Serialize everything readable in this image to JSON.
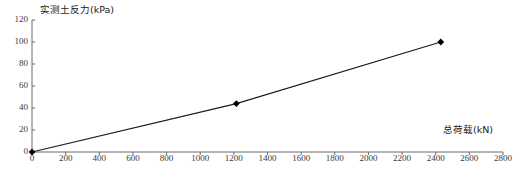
{
  "chart_data": {
    "type": "line",
    "title": "",
    "xlabel": "总荷载(kN)",
    "ylabel": "实测土反力(kPa)",
    "xlim": [
      0,
      2800
    ],
    "ylim": [
      0,
      120
    ],
    "grid": false,
    "legend": null,
    "marker": "diamond",
    "line_color": "#1a1a1a",
    "marker_color": "#000000",
    "xticks": [
      0,
      200,
      400,
      600,
      800,
      1000,
      1200,
      1400,
      1600,
      1800,
      2000,
      2200,
      2400,
      2600,
      2800
    ],
    "yticks": [
      0,
      20,
      40,
      60,
      80,
      100,
      120
    ],
    "x": [
      0,
      1215,
      2430
    ],
    "values": [
      0,
      44,
      100
    ],
    "series": [
      {
        "name": "实测土反力",
        "points": [
          {
            "x": 0,
            "y": 0
          },
          {
            "x": 1215,
            "y": 44
          },
          {
            "x": 2430,
            "y": 100
          }
        ]
      }
    ]
  }
}
